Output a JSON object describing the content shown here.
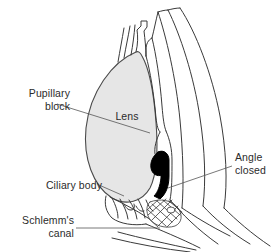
{
  "figure": {
    "name": "eye-anterior-segment-diagram",
    "background_color": "#ffffff"
  },
  "labels": {
    "pupillary_block": "Pupillary\nblock",
    "lens": "Lens",
    "ciliary_body": "Ciliary body",
    "schlemms_canal": "Schlemm's\ncanal",
    "angle_closed": "Angle\nclosed"
  },
  "colors": {
    "outline": "#3a3a3a",
    "lens_fill": "#e6e6e6",
    "iris_root_fill": "#000000",
    "leader_line": "#555555",
    "text": "#2b2b2b"
  },
  "structures": [
    {
      "id": "lens",
      "label": "Lens",
      "fill": "#e6e6e6"
    },
    {
      "id": "cornea",
      "label": "Cornea",
      "fill": "none"
    },
    {
      "id": "sclera",
      "label": "Sclera",
      "fill": "none"
    },
    {
      "id": "iris",
      "label": "Iris",
      "fill": "#000000"
    },
    {
      "id": "ciliary-body",
      "label": "Ciliary body",
      "fill": "none"
    },
    {
      "id": "trabecular-meshwork",
      "label": "Trabecular meshwork",
      "fill": "none"
    },
    {
      "id": "zonules",
      "label": "Zonular fibers",
      "fill": "none"
    }
  ]
}
